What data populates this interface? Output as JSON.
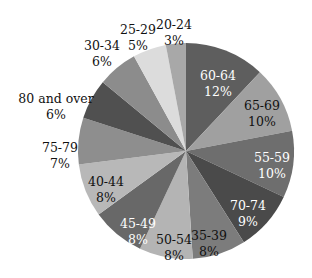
{
  "chart_data": {
    "type": "pie",
    "title": "",
    "start_angle_deg": 0,
    "direction": "clockwise",
    "slices": [
      {
        "label": "60-64",
        "value": 12,
        "pct_label": "12%",
        "color": "#5e5e5e",
        "text_color": "#ffffff",
        "lx": 218,
        "ly": 80
      },
      {
        "label": "65-69",
        "value": 10,
        "pct_label": "10%",
        "color": "#a0a0a0",
        "text_color": "#111111",
        "lx": 262,
        "ly": 110
      },
      {
        "label": "55-59",
        "value": 10,
        "pct_label": "10%",
        "color": "#6e6e6e",
        "text_color": "#ffffff",
        "lx": 272,
        "ly": 162
      },
      {
        "label": "70-74",
        "value": 9,
        "pct_label": "9%",
        "color": "#4a4a4a",
        "text_color": "#ffffff",
        "lx": 248,
        "ly": 210
      },
      {
        "label": "35-39",
        "value": 8,
        "pct_label": "8%",
        "color": "#7c7c7c",
        "text_color": "#111111",
        "lx": 209,
        "ly": 240
      },
      {
        "label": "50-54",
        "value": 8,
        "pct_label": "8%",
        "color": "#b4b4b4",
        "text_color": "#111111",
        "lx": 174,
        "ly": 244
      },
      {
        "label": "45-49",
        "value": 8,
        "pct_label": "8%",
        "color": "#686868",
        "text_color": "#ffffff",
        "lx": 138,
        "ly": 228
      },
      {
        "label": "40-44",
        "value": 8,
        "pct_label": "8%",
        "color": "#b8b8b8",
        "text_color": "#111111",
        "lx": 106,
        "ly": 186
      },
      {
        "label": "75-79",
        "value": 7,
        "pct_label": "7%",
        "color": "#8e8e8e",
        "text_color": "#111111",
        "lx": 60,
        "ly": 152
      },
      {
        "label": "80 and over",
        "value": 6,
        "pct_label": "6%",
        "color": "#505050",
        "text_color": "#111111",
        "lx": 56,
        "ly": 103
      },
      {
        "label": "30-34",
        "value": 6,
        "pct_label": "6%",
        "color": "#8c8c8c",
        "text_color": "#111111",
        "lx": 102,
        "ly": 50
      },
      {
        "label": "25-29",
        "value": 5,
        "pct_label": "5%",
        "color": "#dcdcdc",
        "text_color": "#111111",
        "lx": 138,
        "ly": 34
      },
      {
        "label": "20-24",
        "value": 3,
        "pct_label": "3%",
        "color": "#a8a8a8",
        "text_color": "#111111",
        "lx": 174,
        "ly": 29
      }
    ],
    "center": [
      186,
      151
    ],
    "radius": 108,
    "legend": "none"
  }
}
